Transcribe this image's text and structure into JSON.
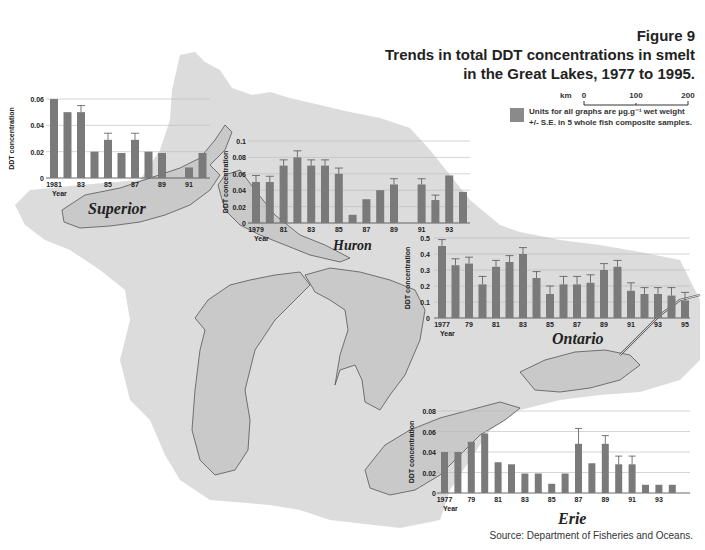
{
  "header": {
    "figure_number": "Figure 9",
    "title_line1": "Trends in total DDT concentrations in smelt",
    "title_line2": "in the Great Lakes, 1977 to 1995."
  },
  "scale_bar": {
    "unit": "km",
    "ticks": [
      "0",
      "100",
      "200"
    ]
  },
  "legend": {
    "line1": "Units for all graphs are µg.g⁻¹ wet weight",
    "line2": "+/- S.E. in 5 whole fish composite samples.",
    "swatch_color": "#8a8a8a"
  },
  "source": "Source: Department of Fisheries and Oceans.",
  "colors": {
    "bar": "#7a7a7a",
    "land": "#dcdcdc",
    "lake": "#c9c9c9",
    "outline": "#555555",
    "grid": "#bbbbbb"
  },
  "lake_labels": {
    "superior": "Superior",
    "huron": "Huron",
    "ontario": "Ontario",
    "erie": "Erie"
  },
  "chart_data": [
    {
      "type": "bar",
      "title": "Superior",
      "xlabel": "Year",
      "ylabel": "DDT concentration",
      "ylim": [
        0,
        0.06
      ],
      "yticks": [
        "0",
        "0.02",
        "0.04",
        "0.06"
      ],
      "xticks": [
        "1981",
        "83",
        "85",
        "87",
        "89",
        "91"
      ],
      "categories": [
        "1981",
        "1982",
        "1983",
        "1984",
        "1985",
        "1986",
        "1987",
        "1988",
        "1989",
        "1990",
        "1991",
        "1992"
      ],
      "values": [
        0.06,
        0.05,
        0.05,
        0.02,
        0.029,
        0.019,
        0.029,
        0.02,
        0.019,
        null,
        0.008,
        0.019
      ],
      "errors": [
        0,
        0,
        0.005,
        0,
        0.005,
        0,
        0.005,
        0,
        0,
        0,
        0,
        0
      ],
      "grid": true
    },
    {
      "type": "bar",
      "title": "Huron",
      "xlabel": "Year",
      "ylabel": "DDT concentration",
      "ylim": [
        0,
        0.1
      ],
      "yticks": [
        "0",
        "0.02",
        "0.04",
        "0.06",
        "0.08",
        "0.1"
      ],
      "xticks": [
        "1979",
        "81",
        "83",
        "85",
        "87",
        "89",
        "91",
        "93"
      ],
      "categories": [
        "1979",
        "1980",
        "1981",
        "1982",
        "1983",
        "1984",
        "1985",
        "1986",
        "1987",
        "1988",
        "1989",
        "1990",
        "1991",
        "1992",
        "1993",
        "1994"
      ],
      "values": [
        0.05,
        0.05,
        0.07,
        0.08,
        0.07,
        0.07,
        0.06,
        0.01,
        0.029,
        0.04,
        0.047,
        null,
        0.047,
        0.028,
        0.058,
        0.038
      ],
      "errors": [
        0.008,
        0.007,
        0.007,
        0.008,
        0.007,
        0.007,
        0.007,
        0,
        0,
        0,
        0.007,
        0,
        0.007,
        0.006,
        0,
        0
      ],
      "grid": true
    },
    {
      "type": "bar",
      "title": "Ontario",
      "xlabel": "Year",
      "ylabel": "DDT concentration",
      "ylim": [
        0,
        0.5
      ],
      "yticks": [
        "0",
        "0.1",
        "0.2",
        "0.3",
        "0.4",
        "0.5"
      ],
      "xticks": [
        "1977",
        "79",
        "81",
        "83",
        "85",
        "87",
        "89",
        "91",
        "93",
        "95"
      ],
      "categories": [
        "1977",
        "1978",
        "1979",
        "1980",
        "1981",
        "1982",
        "1983",
        "1984",
        "1985",
        "1986",
        "1987",
        "1988",
        "1989",
        "1990",
        "1991",
        "1992",
        "1993",
        "1994",
        "1995"
      ],
      "values": [
        0.45,
        0.33,
        0.34,
        0.21,
        0.32,
        0.35,
        0.4,
        0.25,
        0.15,
        0.21,
        0.21,
        0.22,
        0.3,
        0.32,
        0.17,
        0.15,
        0.15,
        0.14,
        0.11
      ],
      "errors": [
        0.04,
        0.04,
        0.04,
        0.05,
        0.04,
        0.04,
        0.04,
        0.04,
        0.05,
        0.05,
        0.05,
        0.05,
        0.04,
        0.04,
        0.05,
        0.04,
        0.04,
        0.05,
        0.05
      ],
      "grid": true
    },
    {
      "type": "bar",
      "title": "Erie",
      "xlabel": "Year",
      "ylabel": "DDT concentration",
      "ylim": [
        0,
        0.08
      ],
      "yticks": [
        "0",
        "0.02",
        "0.04",
        "0.06",
        "0.08"
      ],
      "xticks": [
        "1977",
        "79",
        "81",
        "83",
        "85",
        "87",
        "89",
        "91",
        "93"
      ],
      "categories": [
        "1977",
        "1978",
        "1979",
        "1980",
        "1981",
        "1982",
        "1983",
        "1984",
        "1985",
        "1986",
        "1987",
        "1988",
        "1989",
        "1990",
        "1991",
        "1992",
        "1993",
        "1994"
      ],
      "values": [
        0.04,
        0.04,
        0.05,
        0.058,
        0.03,
        0.028,
        0.019,
        0.019,
        0.009,
        0.019,
        0.048,
        0.029,
        0.048,
        0.028,
        0.028,
        0.008,
        0.008,
        0.008
      ],
      "errors": [
        0,
        0,
        0,
        0,
        0,
        0,
        0,
        0,
        0,
        0,
        0.015,
        0,
        0.008,
        0.008,
        0.008,
        0,
        0,
        0
      ],
      "grid": true
    }
  ]
}
